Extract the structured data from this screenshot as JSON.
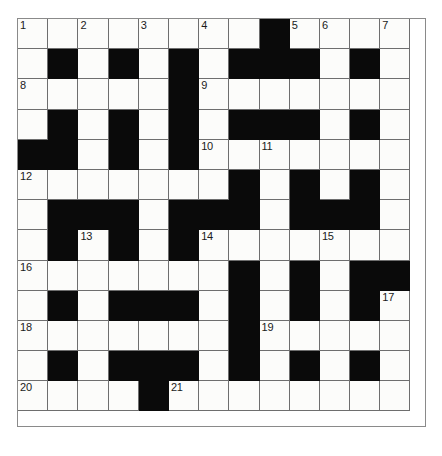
{
  "puzzle": {
    "title": "Crossword Grid",
    "type": "crossword",
    "rows": 13,
    "columns": 13,
    "cell_size_px": 30.2,
    "colors": {
      "block": "#0a0a0a",
      "cell": "#fcfcfa",
      "grid_line": "#6e6e6e",
      "number_text": "#1a1a1a",
      "page_background": "#ffffff"
    },
    "grid": [
      [
        "w",
        "w",
        "w",
        "w",
        "w",
        "w",
        "w",
        "w",
        "b",
        "w",
        "w",
        "w",
        "w"
      ],
      [
        "w",
        "b",
        "w",
        "b",
        "w",
        "b",
        "w",
        "b",
        "b",
        "b",
        "w",
        "b",
        "w"
      ],
      [
        "w",
        "w",
        "w",
        "w",
        "w",
        "b",
        "w",
        "w",
        "w",
        "w",
        "w",
        "w",
        "w"
      ],
      [
        "w",
        "b",
        "w",
        "b",
        "w",
        "b",
        "w",
        "b",
        "b",
        "b",
        "w",
        "b",
        "w"
      ],
      [
        "b",
        "b",
        "w",
        "b",
        "w",
        "b",
        "w",
        "w",
        "w",
        "w",
        "w",
        "w",
        "w"
      ],
      [
        "w",
        "w",
        "w",
        "w",
        "w",
        "w",
        "w",
        "b",
        "w",
        "b",
        "w",
        "b",
        "w"
      ],
      [
        "w",
        "b",
        "b",
        "b",
        "w",
        "b",
        "b",
        "b",
        "w",
        "b",
        "b",
        "b",
        "w"
      ],
      [
        "w",
        "b",
        "w",
        "b",
        "w",
        "b",
        "w",
        "w",
        "w",
        "w",
        "w",
        "w",
        "w"
      ],
      [
        "w",
        "w",
        "w",
        "w",
        "w",
        "w",
        "w",
        "b",
        "w",
        "b",
        "w",
        "b",
        "b"
      ],
      [
        "w",
        "b",
        "w",
        "b",
        "b",
        "b",
        "w",
        "b",
        "w",
        "b",
        "w",
        "b",
        "w"
      ],
      [
        "w",
        "w",
        "w",
        "w",
        "w",
        "w",
        "w",
        "b",
        "w",
        "w",
        "w",
        "w",
        "w"
      ],
      [
        "w",
        "b",
        "w",
        "b",
        "b",
        "b",
        "w",
        "b",
        "w",
        "b",
        "w",
        "b",
        "w"
      ],
      [
        "w",
        "w",
        "w",
        "w",
        "b",
        "w",
        "w",
        "w",
        "w",
        "w",
        "w",
        "w",
        "w"
      ]
    ],
    "numbers": [
      {
        "row": 0,
        "col": 0,
        "label": "1"
      },
      {
        "row": 0,
        "col": 2,
        "label": "2"
      },
      {
        "row": 0,
        "col": 4,
        "label": "3"
      },
      {
        "row": 0,
        "col": 6,
        "label": "4"
      },
      {
        "row": 0,
        "col": 9,
        "label": "5"
      },
      {
        "row": 0,
        "col": 10,
        "label": "6"
      },
      {
        "row": 0,
        "col": 12,
        "label": "7"
      },
      {
        "row": 2,
        "col": 0,
        "label": "8"
      },
      {
        "row": 2,
        "col": 6,
        "label": "9"
      },
      {
        "row": 4,
        "col": 6,
        "label": "10"
      },
      {
        "row": 4,
        "col": 8,
        "label": "11"
      },
      {
        "row": 5,
        "col": 0,
        "label": "12"
      },
      {
        "row": 7,
        "col": 2,
        "label": "13"
      },
      {
        "row": 7,
        "col": 6,
        "label": "14"
      },
      {
        "row": 7,
        "col": 10,
        "label": "15"
      },
      {
        "row": 8,
        "col": 0,
        "label": "16"
      },
      {
        "row": 9,
        "col": 12,
        "label": "17"
      },
      {
        "row": 10,
        "col": 0,
        "label": "18"
      },
      {
        "row": 10,
        "col": 8,
        "label": "19"
      },
      {
        "row": 12,
        "col": 0,
        "label": "20"
      },
      {
        "row": 12,
        "col": 5,
        "label": "21"
      }
    ],
    "entries": []
  }
}
